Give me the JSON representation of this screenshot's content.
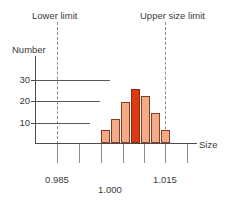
{
  "labels": {
    "lower_limit": "Lower limit",
    "upper_size_limit": "Upper size limit",
    "number_axis": "Number",
    "size_axis": "Size"
  },
  "y_ticks": [
    "30",
    "20",
    "10"
  ],
  "x_ticks": [
    "0.985",
    "1.000",
    "1.015"
  ],
  "colors": {
    "bar_fill": "#f2ab85",
    "bar_stroke": "#8a3b20",
    "bar_highlight_fill": "#dc3a12",
    "bar_highlight_stroke": "#8a2a10",
    "axis": "#4a4a4a",
    "gridline": "#5a5a5a",
    "limit_line": "#8c8c8c",
    "text": "#3a3a3a"
  },
  "chart_data": {
    "type": "bar",
    "title": "",
    "xlabel": "Size",
    "ylabel": "Number",
    "categories": [
      "1.0005",
      "1.0015",
      "1.0025",
      "1.0035",
      "1.0045",
      "1.0055",
      "1.0065"
    ],
    "values": [
      6,
      11,
      19,
      25,
      22,
      14,
      6
    ],
    "highlight_index": 3,
    "ylim": [
      0,
      35
    ],
    "y_tick_values": [
      10,
      20,
      30
    ],
    "xlim": [
      0.9795,
      1.0195
    ],
    "x_tick_values": [
      0.985,
      0.99,
      0.995,
      1.0,
      1.005,
      1.01,
      1.015,
      1.02
    ],
    "x_labeled_ticks": [
      {
        "value": 0.985,
        "label": "0.985"
      },
      {
        "value": 1.0,
        "label": "1.000"
      },
      {
        "value": 1.015,
        "label": "1.015"
      }
    ],
    "grid": true,
    "grid_axis": "y",
    "legend": "none",
    "annotations": [
      {
        "text": "Lower limit",
        "type": "vertical-dashed-line",
        "value": 0.9845
      },
      {
        "text": "Upper size limit",
        "type": "vertical-dashed-line",
        "value": 1.0145
      }
    ]
  }
}
